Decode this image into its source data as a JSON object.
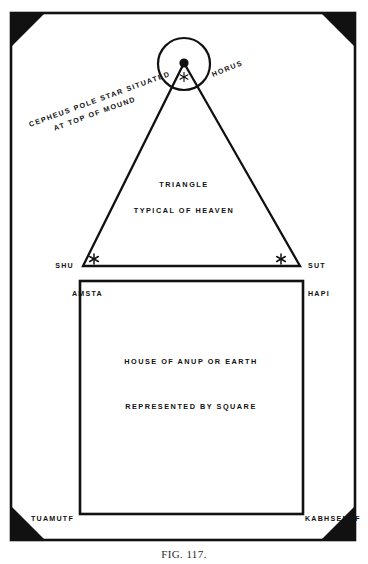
{
  "plate": {
    "title": "Egyptian cosmological diagram plate",
    "background_color": "#ffffff",
    "ink_color": "#111111",
    "frame": {
      "x": 11,
      "y": 13,
      "width": 344,
      "height": 527,
      "stroke_width": 2.6
    },
    "corner_ornaments": {
      "shape": "filled-triangle",
      "size": 34,
      "color": "#111111",
      "count": 4
    }
  },
  "heaven": {
    "triangle": {
      "apex": {
        "x": 184,
        "y": 63
      },
      "base_left": {
        "x": 83,
        "y": 266
      },
      "base_right": {
        "x": 300,
        "y": 266
      }
    },
    "circle": {
      "cx": 184,
      "cy": 64,
      "r": 26,
      "stroke_width": 2.2
    },
    "pole_dot": {
      "cx": 184,
      "cy": 63,
      "r": 4.6
    },
    "inner_star": {
      "cx": 184,
      "cy": 77,
      "size": 9
    },
    "label_triangle": "TRIANGLE",
    "label_typical": "TYPICAL OF HEAVEN",
    "label_horus": "HORUS",
    "label_cepheus_line1": "CEPHEUS POLE STAR SITUATED",
    "label_cepheus_line2": "AT TOP OF MOUND",
    "cepheus_rotation_deg": -20,
    "horus_rotation_deg": -22,
    "base_stars": [
      {
        "name": "shu-star",
        "cx": 94,
        "cy": 259,
        "size": 10
      },
      {
        "name": "sut-star",
        "cx": 281,
        "cy": 259,
        "size": 10
      }
    ],
    "corner_labels": {
      "left": "SHU",
      "right": "SUT"
    }
  },
  "earth": {
    "square": {
      "x": 80,
      "y": 281,
      "width": 223,
      "height": 233,
      "stroke_width": 2.6
    },
    "label_house": "HOUSE OF ANUP OR EARTH",
    "label_represented": "REPRESENTED BY SQUARE",
    "corner_labels": {
      "top_left": "AMSTA",
      "top_right": "HAPI",
      "bottom_left": "TUAMUTF",
      "bottom_right": "KABHSENUF"
    }
  },
  "caption": {
    "text": "FIG. 117."
  }
}
